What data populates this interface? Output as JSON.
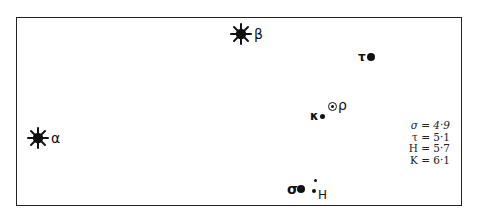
{
  "diagram": {
    "type": "star-map",
    "stars": [
      {
        "id": "alpha",
        "label": "α",
        "symbol": "bright-star",
        "x": 38,
        "y": 138
      },
      {
        "id": "beta",
        "label": "β",
        "symbol": "bright-star",
        "x": 241,
        "y": 34
      },
      {
        "id": "tau",
        "label": "τ",
        "symbol": "dot",
        "x": 371,
        "y": 57
      },
      {
        "id": "rho",
        "label": "ρ",
        "symbol": "ring-dot",
        "x": 333,
        "y": 107
      },
      {
        "id": "kappa",
        "label": "κ",
        "symbol": "small-dot",
        "x": 322,
        "y": 116
      },
      {
        "id": "sigma",
        "label": "σ",
        "symbol": "dot",
        "x": 301,
        "y": 189
      },
      {
        "id": "H",
        "label": "H",
        "symbol": "small-dot",
        "x": 314,
        "y": 191
      },
      {
        "id": "unlabeled",
        "label": "",
        "symbol": "tiny-dot",
        "x": 315,
        "y": 180
      }
    ],
    "legend": [
      {
        "label": "σ",
        "value": "4·9"
      },
      {
        "label": "τ",
        "value": "5·1"
      },
      {
        "label": "H",
        "value": "5·7"
      },
      {
        "label": "K",
        "value": "6·1"
      }
    ],
    "legend_rows": [
      "σ = 4·9",
      "τ = 5·1",
      "H = 5·7",
      "K = 6·1"
    ],
    "colors": {
      "ink": "#111111",
      "background": "#ffffff",
      "frame": "#222222"
    }
  }
}
